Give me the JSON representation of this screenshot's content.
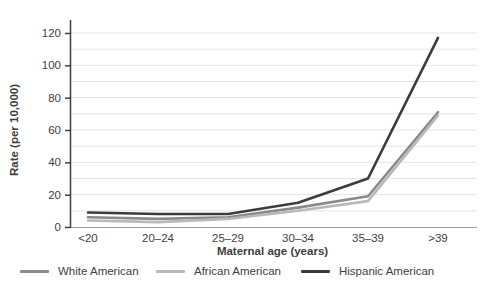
{
  "chart_data": {
    "type": "line",
    "title": "",
    "xlabel": "Maternal age (years)",
    "ylabel": "Rate (per 10,000)",
    "categories": [
      "<20",
      "20–24",
      "25–29",
      "30–34",
      "35–39",
      ">39"
    ],
    "series": [
      {
        "name": "White American",
        "color": "#8a8a8a",
        "values": [
          6,
          5,
          6,
          12,
          19,
          71
        ]
      },
      {
        "name": "African American",
        "color": "#b9b9b9",
        "values": [
          4,
          3,
          5,
          10,
          16,
          69
        ]
      },
      {
        "name": "Hispanic American",
        "color": "#3c3c3c",
        "values": [
          9,
          8,
          8,
          15,
          30,
          117
        ]
      }
    ],
    "ylim": [
      0,
      120
    ],
    "y_tick_step": 20,
    "y_gridline_step": 10,
    "y_tick_labels": [
      "0",
      "20",
      "40",
      "60",
      "80",
      "100",
      "120"
    ],
    "grid": true,
    "legend_position": "bottom",
    "gridline_color": "#e4e4e4",
    "axis_color": "#3e3e3e",
    "x_axis_line_color": "#9b9b9b"
  }
}
